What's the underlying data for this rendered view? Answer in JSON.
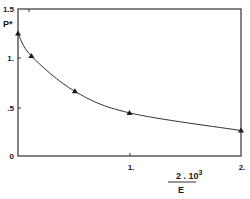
{
  "chart_data": {
    "type": "line",
    "title": "",
    "xlabel": "2.10^3 / E",
    "ylabel": "P*",
    "xlim": [
      0,
      2
    ],
    "ylim": [
      0,
      1.5
    ],
    "x_ticks": [
      "1.",
      "2."
    ],
    "y_ticks": [
      "0",
      ".5",
      "1.",
      "1.5"
    ],
    "grid": false,
    "legend": null,
    "marker": "triangle",
    "series": [
      {
        "name": "P*",
        "x": [
          0.0,
          0.12,
          0.51,
          1.0,
          2.0
        ],
        "y": [
          1.25,
          1.02,
          0.66,
          0.44,
          0.26
        ]
      }
    ]
  },
  "labels": {
    "y_axis": "P*",
    "x_numerator": "2 . 10",
    "x_exponent": "3",
    "x_denominator": "E",
    "y_tick_0": "0",
    "y_tick_05": ".5",
    "y_tick_1": "1.",
    "y_tick_15": "1.5",
    "x_tick_1": "1.",
    "x_tick_2": "2."
  }
}
